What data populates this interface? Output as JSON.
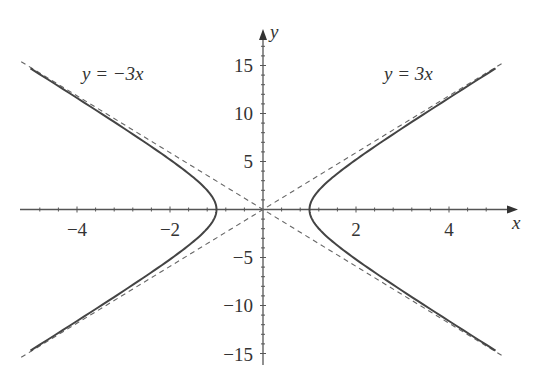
{
  "chart_data": {
    "type": "line",
    "title": "",
    "xlabel": "x",
    "ylabel": "y",
    "xlim": [
      -5.2,
      5.5
    ],
    "ylim": [
      -16,
      18
    ],
    "x_ticks": [
      -4,
      -2,
      2,
      4
    ],
    "x_tick_labels": [
      "−4",
      "−2",
      "2",
      "4"
    ],
    "y_ticks": [
      15,
      10,
      5,
      -5,
      -10,
      -15
    ],
    "y_tick_labels": [
      "15",
      "10",
      "5",
      "−5",
      "−10",
      "−15"
    ],
    "grid": false,
    "series": [
      {
        "name": "hyperbola x^2 - y^2/9 = 1",
        "style": "solid",
        "x_range": [
          -5,
          5
        ],
        "vertices": [
          [
            -1,
            0
          ],
          [
            1,
            0
          ]
        ]
      },
      {
        "name": "y = 3x",
        "style": "dashed",
        "x_range": [
          -5.2,
          5.2
        ]
      },
      {
        "name": "y = -3x",
        "style": "dashed",
        "x_range": [
          -5.2,
          5.2
        ]
      }
    ],
    "annotations": [
      {
        "text": "y = −3x",
        "near": [
          -3.4,
          14
        ]
      },
      {
        "text": "y = 3x",
        "near": [
          3,
          14
        ]
      }
    ]
  },
  "labels": {
    "x_axis": "x",
    "y_axis": "y",
    "left_asymptote": "y = −3x",
    "right_asymptote": "y = 3x",
    "xt0": "−4",
    "xt1": "−2",
    "xt2": "2",
    "xt3": "4",
    "yt0": "15",
    "yt1": "10",
    "yt2": "5",
    "yt3": "−5",
    "yt4": "−10",
    "yt5": "−15"
  }
}
